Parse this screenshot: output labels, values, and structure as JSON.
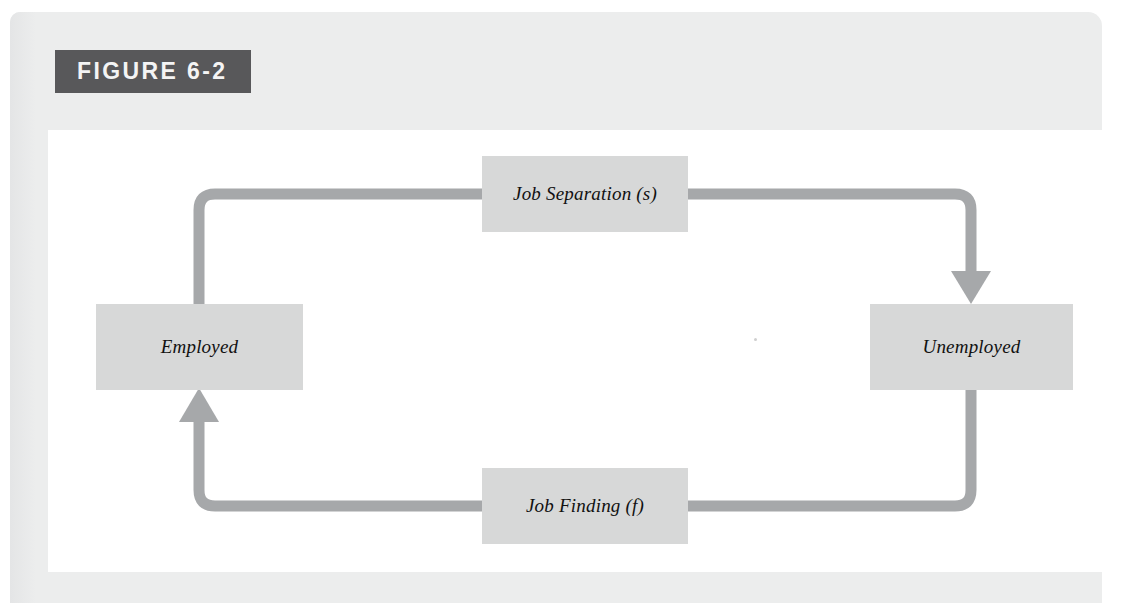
{
  "figure": {
    "banner_label": "FIGURE 6-2",
    "banner_bg_color": "#58585a",
    "banner_text_color": "#f4f4f4",
    "panel_bg_color": "#eceded",
    "canvas_bg_color": "#ffffff"
  },
  "diagram": {
    "type": "cycle-flow",
    "node_fill_color": "#d7d8d8",
    "connector_color": "#a6a8aa",
    "nodes": [
      {
        "id": "job-separation",
        "label": "Job Separation (s)",
        "role": "transition-rate"
      },
      {
        "id": "unemployed",
        "label": "Unemployed",
        "role": "state"
      },
      {
        "id": "job-finding",
        "label": "Job Finding (f)",
        "role": "transition-rate"
      },
      {
        "id": "employed",
        "label": "Employed",
        "role": "state"
      }
    ],
    "edges": [
      {
        "from": "employed",
        "through": "job-separation",
        "to": "unemployed",
        "arrowhead": "down-into-unemployed"
      },
      {
        "from": "unemployed",
        "through": "job-finding",
        "to": "employed",
        "arrowhead": "up-into-employed"
      }
    ]
  }
}
